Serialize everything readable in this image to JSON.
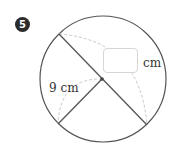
{
  "problem": {
    "number": "5"
  },
  "diagram": {
    "circle": {
      "cx": 103,
      "cy": 79,
      "r": 63
    },
    "center_point": {
      "x": 102,
      "y": 79
    },
    "diameter": {
      "x1": 59,
      "y1": 34,
      "x2": 147,
      "y2": 125
    },
    "radius_segment": {
      "x1": 102,
      "y1": 79,
      "x2": 58,
      "y2": 124
    },
    "given_radius_label": "9 cm",
    "answer_unit": "cm",
    "answer_value": "",
    "colors": {
      "stroke": "#555555",
      "dashed_arc": "#c8c8c8",
      "badge_bg": "#2b2b2b",
      "box_border": "#d6d6d6"
    }
  }
}
